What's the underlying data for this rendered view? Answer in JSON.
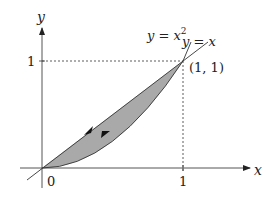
{
  "diagram": {
    "type": "region-between-curves",
    "axes": {
      "x_label": "x",
      "y_label": "y",
      "origin_label": "0",
      "x_tick_label": "1",
      "y_tick_label": "1"
    },
    "curves": [
      {
        "name": "parabola",
        "label": "y = x",
        "superscript": "2"
      },
      {
        "name": "line",
        "label": "y = x"
      }
    ],
    "point_label": "(1, 1)",
    "region_fill": "#a9a9a9",
    "orientation": "counterclockwise"
  }
}
